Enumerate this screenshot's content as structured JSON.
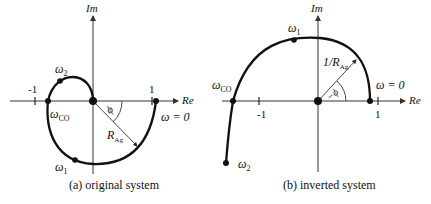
{
  "figure": {
    "panels": [
      {
        "id": "a",
        "caption": "(a) original system",
        "axes": {
          "x_label": "Re",
          "y_label": "Im"
        },
        "ticks": {
          "neg_one": "-1",
          "one": "1"
        },
        "points": {
          "omega_2": {
            "sym": "ω",
            "sub": "2"
          },
          "omega_co": {
            "sym": "ω",
            "sub": "CO"
          },
          "omega_1": {
            "sym": "ω",
            "sub": "1"
          },
          "omega_0": {
            "text": "ω = 0"
          }
        },
        "angle_label": "ϕ",
        "radius_label": {
          "main": "R",
          "sub": "Ag"
        }
      },
      {
        "id": "b",
        "caption": "(b) inverted system",
        "axes": {
          "x_label": "Re",
          "y_label": "Im"
        },
        "ticks": {
          "neg_one": "-1",
          "one": "1"
        },
        "points": {
          "omega_1": {
            "sym": "ω",
            "sub": "1"
          },
          "omega_co": {
            "sym": "ω",
            "sub": "CO"
          },
          "omega_2": {
            "sym": "ω",
            "sub": "2"
          },
          "omega_0": {
            "text": "ω = 0"
          }
        },
        "angle_label": "−ϕ",
        "radius_label": {
          "main": "1/R",
          "sub": "Ag"
        }
      }
    ],
    "colors": {
      "line": "#111111",
      "background": "#ffffff",
      "axis": "#333333"
    }
  }
}
